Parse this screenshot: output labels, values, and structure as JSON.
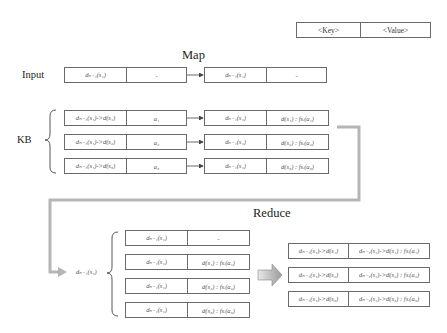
{
  "legend": {
    "key": "<Key>",
    "value": "<Value>"
  },
  "map": {
    "title": "Map",
    "input_label": "Input",
    "kb_label": "KB",
    "input_row": {
      "in": {
        "key": "dₙ₋₁(s₁)",
        "value": "-"
      },
      "out": {
        "key": "dₙ₋₁(s₁)",
        "value": "-"
      }
    },
    "kb_rows": [
      {
        "in": {
          "key": "dₙ₋₁(s₁)->d(s₁)",
          "value": "a₁"
        },
        "out": {
          "key": "dₙ₋₁(s₁)",
          "value": "d(s₁) : fsᵢ(a₁)"
        }
      },
      {
        "in": {
          "key": "dₙ₋₁(s₁)->d(s₂)",
          "value": "a₂"
        },
        "out": {
          "key": "dₙ₋₁(s₁)",
          "value": "d(s₂) : fsᵢ(a₂)"
        }
      },
      {
        "in": {
          "key": "dₙ₋₁(s₁)->d(s₃)",
          "value": "a₃"
        },
        "out": {
          "key": "dₙ₋₁(s₁)",
          "value": "d(s₃) : fsᵢ(a₃)"
        }
      }
    ]
  },
  "reduce": {
    "title": "Reduce",
    "group_key": "dₙ₋₁(s₁)",
    "group_rows": [
      {
        "key": "dₙ₋₁(s₁)",
        "value": "-"
      },
      {
        "key": "dₙ₋₁(s₁)",
        "value": "d(s₁) : fsᵢ(a₁)"
      },
      {
        "key": "dₙ₋₁(s₁)",
        "value": "d(s₂) : fsᵢ(a₂)"
      },
      {
        "key": "dₙ₋₁(s₁)",
        "value": "d(s₃) : fsᵢ(a₃)"
      }
    ],
    "output_rows": [
      {
        "key": "dₙ₋₁(s₁)->d(s₁)",
        "value": "dₙ₋₁(s₁)->d(s₁) : fsᵢ(a₁)"
      },
      {
        "key": "dₙ₋₁(s₁)->d(s₂)",
        "value": "dₙ₋₁(s₁)->d(s₂) : fsᵢ(a₂)"
      },
      {
        "key": "dₙ₋₁(s₁)->d(s₃)",
        "value": "dₙ₋₁(s₁)->d(s₃) : fsᵢ(a₃)"
      }
    ]
  },
  "colors": {
    "border": "#6a6a6a",
    "flow_arrow": "#b5b5b5",
    "text": "#222222"
  }
}
